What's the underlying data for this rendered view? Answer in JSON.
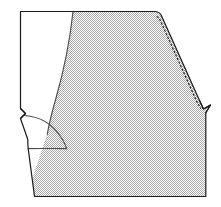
{
  "figure": {
    "kind": "line-drawing",
    "background_color": "#ffffff",
    "canvas": {
      "width": 221,
      "height": 207
    }
  },
  "regions": {
    "shaded_panel": {
      "name": "shaded-fabric-panel",
      "fill_style": "fine checkerboard dither",
      "fill_color": "#cfcfcf",
      "dot_color": "#9a9a9a",
      "description": "Large stippled/hatched area filling the right and lower portion of the pattern piece"
    },
    "unshaded_panel": {
      "name": "unshaded-extension-panel",
      "fill_color": "#ffffff",
      "description": "Plain white rectangle-like extension on the upper left of the pattern piece"
    }
  },
  "lines": {
    "outline": {
      "name": "pattern-outline",
      "color": "#1a1a1a",
      "width": 1.1,
      "style": "solid"
    },
    "panel_divider": {
      "name": "panel-divider-curve",
      "color": "#3c3c3c",
      "width": 1.1,
      "style": "solid",
      "description": "Curved line separating the white extension from the shaded panel"
    },
    "stitch": {
      "name": "stitch-line",
      "color": "#1a1a1a",
      "width": 1.0,
      "style": "dashed",
      "dash_pattern": "2,1.6",
      "description": "Dashed seam/stitch line running parallel just inside the upper right diagonal edge"
    },
    "inner_curve": {
      "name": "inner-armhole-curve",
      "color": "#3c3c3c",
      "width": 1.1,
      "style": "solid",
      "description": "Concave curve sweeping from the notch down to the lower outline"
    }
  },
  "markers": {
    "left_notch": {
      "name": "left-edge-notch",
      "description": "Small V shaped notch cut into the straight left edge"
    },
    "right_tab": {
      "name": "right-corner-tab",
      "description": "Small pointed tab where the diagonal edge meets the vertical right edge"
    }
  },
  "geometry": {
    "outline_path": "M 20.5,11.5 L 155,11.5 C 158,11.5 159.5,12.5 161,14.5 L 199,100 L 203,108.5 L 210,105 L 205.5,112.5 L 205.5,196 L 34.5,196 L 28,148.5 C 27.8,146 27.6,143 27.6,140 L 20.5,118.5 L 25.5,113.5 L 20.5,108.5 Z",
    "divider_path": "M 73,11.5 C 70,40 64,70 56,98 C 52,112 49,124 47.5,133.5",
    "stitch_path": "M 157.5,16.5 L 196,100.5 L 200.5,108",
    "inner_curve_path": "M 24.5,115 C 40,116 52,124 60,136 C 63.5,141 65.5,145 66.5,148.5",
    "lower_outline_path": "M 28,148.5 C 38,148 52,148.5 66.5,148.5 C 90,148.5 130,148.3 205.5,148"
  }
}
